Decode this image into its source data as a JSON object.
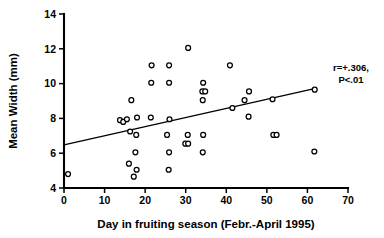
{
  "chart_data": {
    "type": "scatter",
    "title": "",
    "xlabel": "Day in fruiting season  (Febr.-April 1995)",
    "ylabel": "Mean Width (mm)",
    "xlim": [
      0,
      70
    ],
    "ylim": [
      4,
      14
    ],
    "xticks": [
      0,
      10,
      20,
      30,
      40,
      50,
      60,
      70
    ],
    "yticks": [
      4,
      6,
      8,
      10,
      12,
      14
    ],
    "xtick_labels": [
      "0",
      "10",
      "20",
      "30",
      "40",
      "50",
      "60",
      "70"
    ],
    "ytick_labels": [
      "4",
      "6",
      "8",
      "10",
      "12",
      "14"
    ],
    "grid": false,
    "legend": null,
    "marker": "open-circle",
    "points": [
      {
        "x": 1.0,
        "y": 4.8
      },
      {
        "x": 13.8,
        "y": 7.9
      },
      {
        "x": 14.6,
        "y": 7.8
      },
      {
        "x": 15.5,
        "y": 7.95
      },
      {
        "x": 16.0,
        "y": 5.4
      },
      {
        "x": 16.3,
        "y": 7.25
      },
      {
        "x": 16.6,
        "y": 9.05
      },
      {
        "x": 17.2,
        "y": 4.65
      },
      {
        "x": 17.6,
        "y": 6.05
      },
      {
        "x": 17.8,
        "y": 7.05
      },
      {
        "x": 17.9,
        "y": 5.05
      },
      {
        "x": 18.0,
        "y": 8.05
      },
      {
        "x": 21.4,
        "y": 8.05
      },
      {
        "x": 21.5,
        "y": 10.05
      },
      {
        "x": 21.6,
        "y": 11.05
      },
      {
        "x": 25.4,
        "y": 7.05
      },
      {
        "x": 25.8,
        "y": 5.05
      },
      {
        "x": 25.9,
        "y": 6.05
      },
      {
        "x": 26.0,
        "y": 7.95
      },
      {
        "x": 25.9,
        "y": 10.05
      },
      {
        "x": 25.9,
        "y": 11.05
      },
      {
        "x": 29.9,
        "y": 6.55
      },
      {
        "x": 30.6,
        "y": 6.55
      },
      {
        "x": 30.5,
        "y": 7.05
      },
      {
        "x": 30.6,
        "y": 12.05
      },
      {
        "x": 34.2,
        "y": 6.05
      },
      {
        "x": 34.3,
        "y": 7.05
      },
      {
        "x": 34.2,
        "y": 9.05
      },
      {
        "x": 34.1,
        "y": 9.55
      },
      {
        "x": 34.8,
        "y": 9.55
      },
      {
        "x": 34.3,
        "y": 10.05
      },
      {
        "x": 40.9,
        "y": 11.05
      },
      {
        "x": 41.5,
        "y": 8.6
      },
      {
        "x": 44.5,
        "y": 9.05
      },
      {
        "x": 45.5,
        "y": 8.1
      },
      {
        "x": 45.6,
        "y": 9.55
      },
      {
        "x": 51.4,
        "y": 9.1
      },
      {
        "x": 51.6,
        "y": 7.05
      },
      {
        "x": 52.4,
        "y": 7.05
      },
      {
        "x": 61.7,
        "y": 6.1
      },
      {
        "x": 61.8,
        "y": 9.65
      }
    ],
    "regression_line": {
      "x_start": 0,
      "y_start": 6.48,
      "x_end": 62.0,
      "y_end": 9.72
    },
    "annotations": [
      {
        "line1": "r=+.306,",
        "line2": "P<.01",
        "x": 64.5,
        "y": 10.4
      }
    ]
  },
  "annotation_labels": {
    "correlation": "r=+.306,",
    "pvalue": "P<.01"
  }
}
